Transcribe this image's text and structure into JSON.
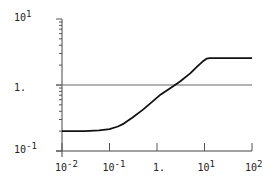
{
  "chart_data": {
    "type": "line",
    "title": "",
    "xlabel": "",
    "ylabel": "",
    "xscale": "log",
    "yscale": "log",
    "xlim": [
      0.01,
      100
    ],
    "ylim": [
      0.1,
      10
    ],
    "grid": false,
    "reference_line": {
      "y": 1
    },
    "x_ticks": [
      {
        "base": "10",
        "exp": "-2",
        "value": 0.01
      },
      {
        "base": "10",
        "exp": "-1",
        "value": 0.1
      },
      {
        "base": "1.",
        "exp": "",
        "value": 1
      },
      {
        "base": "10",
        "exp": "1",
        "value": 10
      },
      {
        "base": "10",
        "exp": "2",
        "value": 100
      }
    ],
    "y_ticks": [
      {
        "base": "10",
        "exp": "1",
        "value": 10
      },
      {
        "base": "1.",
        "exp": "",
        "value": 1
      },
      {
        "base": "10",
        "exp": "-1",
        "value": 0.1
      }
    ],
    "series": [
      {
        "name": "response",
        "color": "#111111",
        "x": [
          0.01,
          0.03,
          0.06,
          0.1,
          0.15,
          0.2,
          0.3,
          0.5,
          0.8,
          1.2,
          2.0,
          3.0,
          5.0,
          7.0,
          9.0,
          11.0,
          13.0,
          20.0,
          50.0,
          100.0
        ],
        "y": [
          0.2,
          0.2,
          0.205,
          0.215,
          0.235,
          0.26,
          0.32,
          0.42,
          0.56,
          0.72,
          0.92,
          1.12,
          1.5,
          1.9,
          2.25,
          2.5,
          2.55,
          2.55,
          2.55,
          2.55
        ]
      }
    ]
  }
}
